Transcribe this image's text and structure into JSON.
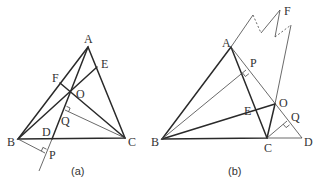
{
  "figures": [
    {
      "caption": "(a)",
      "points": {
        "A": {
          "label": "A",
          "x": 88,
          "y": 47
        },
        "B": {
          "label": "B",
          "x": 18,
          "y": 139
        },
        "C": {
          "label": "C",
          "x": 125,
          "y": 138
        },
        "D": {
          "label": "D",
          "x": 52,
          "y": 139
        },
        "E": {
          "label": "E",
          "x": 97,
          "y": 67
        },
        "F": {
          "label": "F",
          "x": 60,
          "y": 83
        },
        "O": {
          "label": "O",
          "x": 71,
          "y": 93
        },
        "P": {
          "label": "P",
          "x": 45,
          "y": 153
        },
        "Q": {
          "label": "Q",
          "x": 65,
          "y": 110
        }
      }
    },
    {
      "caption": "(b)",
      "points": {
        "A": {
          "label": "A",
          "x": 231,
          "y": 47
        },
        "B": {
          "label": "B",
          "x": 162,
          "y": 139
        },
        "C": {
          "label": "C",
          "x": 267,
          "y": 138
        },
        "D": {
          "label": "D",
          "x": 302,
          "y": 138
        },
        "E": {
          "label": "E",
          "x": 255,
          "y": 110
        },
        "F": {
          "label": "F",
          "x": 280,
          "y": 10
        },
        "O": {
          "label": "O",
          "x": 275,
          "y": 104
        },
        "P": {
          "label": "P",
          "x": 246,
          "y": 70
        },
        "Q": {
          "label": "Q",
          "x": 287,
          "y": 121
        }
      }
    }
  ]
}
